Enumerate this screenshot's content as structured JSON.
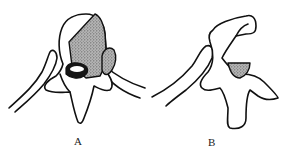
{
  "figure": {
    "panels": [
      {
        "id": "A",
        "label": "A",
        "description": "vertebra, axial view, with shaded lesion in vertebral body and pedicle"
      },
      {
        "id": "B",
        "label": "B",
        "description": "vertebra, oblique view, with small shaded lesion"
      }
    ],
    "colors": {
      "line": "#111111",
      "shading": "#9a9a9a",
      "background": "#ffffff"
    }
  }
}
